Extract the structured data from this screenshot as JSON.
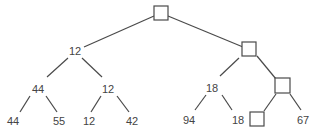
{
  "diagram": {
    "type": "binary-tree",
    "nodes": {
      "root": {
        "value": "",
        "kind": "empty-box"
      },
      "L": {
        "value": "12"
      },
      "R": {
        "value": "",
        "kind": "empty-box"
      },
      "LL": {
        "value": "44"
      },
      "LR": {
        "value": "12"
      },
      "RL": {
        "value": "18"
      },
      "RR": {
        "value": "",
        "kind": "empty-box"
      },
      "LLL": {
        "value": "44"
      },
      "LLR": {
        "value": "55"
      },
      "LRL": {
        "value": "12"
      },
      "LRR": {
        "value": "42"
      },
      "RLL": {
        "value": "94"
      },
      "RLR": {
        "value": "18"
      },
      "RRL": {
        "value": "",
        "kind": "empty-box"
      },
      "RRR": {
        "value": "67"
      }
    }
  }
}
